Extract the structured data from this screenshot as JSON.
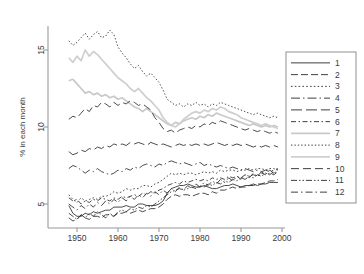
{
  "chart_data": {
    "type": "line",
    "title": "",
    "xlabel": "",
    "ylabel": "% in each month",
    "xlim": [
      1948,
      2000
    ],
    "ylim": [
      3.2,
      16.4
    ],
    "xticks": [
      1950,
      1960,
      1970,
      1980,
      1990,
      2000
    ],
    "yticks": [
      5,
      10,
      15
    ],
    "grid": false,
    "legend_position": "right",
    "x": [
      1948,
      1949,
      1950,
      1951,
      1952,
      1953,
      1954,
      1955,
      1956,
      1957,
      1958,
      1959,
      1960,
      1961,
      1962,
      1963,
      1964,
      1965,
      1966,
      1967,
      1968,
      1969,
      1970,
      1971,
      1972,
      1973,
      1974,
      1975,
      1976,
      1977,
      1978,
      1979,
      1980,
      1981,
      1982,
      1983,
      1984,
      1985,
      1986,
      1987,
      1988,
      1989,
      1990,
      1991,
      1992,
      1993,
      1994,
      1995,
      1996,
      1997,
      1998,
      1999
    ],
    "series": [
      {
        "name": "1",
        "label": "1",
        "style": "solid",
        "color": "#2a2a2a",
        "dash": "none",
        "values": [
          4.9,
          4.4,
          4.2,
          4.2,
          4.4,
          4.3,
          4.5,
          4.4,
          4.5,
          4.6,
          4.6,
          4.8,
          4.8,
          4.8,
          4.9,
          4.8,
          4.8,
          5.0,
          5.0,
          4.9,
          4.9,
          4.9,
          5.0,
          5.2,
          5.7,
          6.0,
          6.1,
          6.2,
          6.2,
          6.3,
          6.2,
          6.1,
          6.1,
          6.2,
          6.1,
          6.0,
          6.0,
          6.1,
          6.2,
          6.2,
          6.3,
          6.2,
          6.1,
          6.2,
          6.2,
          6.3,
          6.2,
          6.3,
          6.3,
          6.4,
          6.4,
          6.4
        ]
      },
      {
        "name": "2",
        "label": "2",
        "style": "dashed",
        "color": "#2a2a2a",
        "dash": "7,3",
        "values": [
          4.1,
          3.9,
          4.0,
          4.3,
          4.1,
          4.0,
          4.2,
          4.2,
          4.1,
          4.3,
          4.3,
          4.2,
          4.4,
          4.4,
          4.5,
          4.4,
          4.5,
          4.6,
          4.5,
          4.6,
          4.7,
          4.7,
          4.8,
          5.0,
          5.3,
          5.5,
          5.6,
          5.5,
          5.6,
          5.6,
          5.5,
          5.6,
          5.7,
          5.7,
          5.6,
          5.8,
          5.7,
          5.9,
          5.9,
          6.0,
          6.1,
          6.0,
          6.1,
          6.1,
          6.2,
          6.2,
          6.3,
          6.3,
          6.4,
          6.5,
          6.5,
          6.6
        ]
      },
      {
        "name": "3",
        "label": "3",
        "style": "dotted",
        "color": "#2a2a2a",
        "dash": "1.6,2.2",
        "values": [
          5.6,
          5.3,
          5.1,
          5.4,
          5.2,
          5.3,
          5.4,
          5.3,
          5.5,
          5.5,
          5.6,
          5.8,
          5.7,
          5.8,
          6.0,
          5.9,
          6.0,
          6.0,
          6.2,
          6.2,
          6.1,
          6.3,
          6.4,
          6.6,
          6.8,
          7.0,
          6.9,
          7.0,
          6.9,
          7.0,
          7.0,
          6.9,
          7.0,
          7.1,
          7.0,
          7.1,
          7.0,
          7.2,
          7.1,
          7.2,
          7.2,
          7.1,
          7.2,
          7.2,
          7.3,
          7.2,
          7.3,
          7.3,
          7.2,
          7.3,
          7.3,
          7.2
        ]
      },
      {
        "name": "4",
        "label": "4",
        "style": "dashdot-long",
        "color": "#2a2a2a",
        "dash": "9,3,1.5,3",
        "values": [
          7.3,
          7.5,
          7.4,
          7.2,
          7.0,
          7.2,
          7.1,
          7.3,
          7.1,
          7.0,
          6.9,
          7.0,
          7.2,
          7.1,
          7.3,
          7.2,
          7.4,
          7.3,
          7.5,
          7.6,
          7.5,
          7.4,
          7.6,
          7.5,
          7.7,
          7.8,
          7.7,
          7.6,
          7.7,
          7.6,
          7.5,
          7.6,
          7.7,
          7.5,
          7.6,
          7.5,
          7.4,
          7.5,
          7.4,
          7.3,
          7.4,
          7.3,
          7.2,
          7.3,
          7.2,
          7.1,
          7.2,
          7.1,
          7.2,
          7.1,
          7.2,
          7.3
        ]
      },
      {
        "name": "5",
        "label": "5",
        "style": "dashed-long",
        "color": "#2a2a2a",
        "dash": "11,4",
        "values": [
          8.4,
          8.2,
          8.3,
          8.5,
          8.4,
          8.6,
          8.5,
          8.7,
          8.6,
          8.8,
          8.7,
          8.9,
          8.8,
          8.9,
          8.8,
          9.0,
          8.9,
          9.0,
          8.9,
          8.8,
          9.0,
          8.9,
          8.8,
          8.9,
          8.8,
          8.7,
          8.8,
          8.9,
          8.8,
          8.9,
          8.8,
          8.9,
          8.8,
          8.9,
          8.8,
          8.9,
          9.0,
          8.9,
          8.8,
          8.9,
          8.8,
          8.9,
          8.8,
          8.9,
          8.8,
          8.7,
          8.8,
          8.7,
          8.8,
          8.7,
          8.8,
          8.7
        ]
      },
      {
        "name": "6",
        "label": "6",
        "style": "dashdot",
        "color": "#2a2a2a",
        "dash": "5,2.5,1.5,2.5",
        "values": [
          5.4,
          5.2,
          5.3,
          5.0,
          5.2,
          5.1,
          5.3,
          5.2,
          5.4,
          5.3,
          5.2,
          5.4,
          5.3,
          5.5,
          5.4,
          5.5,
          5.6,
          5.5,
          5.7,
          5.6,
          5.8,
          5.7,
          5.9,
          6.0,
          6.2,
          6.3,
          6.4,
          6.3,
          6.5,
          6.4,
          6.5,
          6.6,
          6.5,
          6.6,
          6.5,
          6.7,
          6.6,
          6.7,
          6.6,
          6.8,
          6.7,
          6.8,
          6.7,
          6.9,
          6.8,
          6.9,
          6.8,
          7.0,
          6.9,
          7.0,
          6.9,
          7.1
        ]
      },
      {
        "name": "7",
        "label": "7",
        "style": "solid-light",
        "color": "#c9c9c9",
        "dash": "none",
        "values": [
          13.0,
          13.1,
          12.8,
          12.5,
          12.2,
          12.3,
          12.1,
          12.2,
          12.0,
          12.1,
          11.9,
          12.0,
          11.8,
          11.9,
          11.7,
          11.5,
          11.3,
          11.2,
          11.0,
          11.2,
          11.0,
          10.8,
          10.6,
          10.4,
          10.2,
          10.1,
          10.3,
          10.2,
          10.4,
          10.5,
          10.6,
          10.5,
          10.7,
          10.6,
          10.8,
          10.7,
          10.9,
          10.8,
          10.7,
          10.6,
          10.5,
          10.4,
          10.3,
          10.2,
          10.1,
          10.2,
          10.1,
          10.0,
          10.1,
          10.0,
          10.1,
          10.0
        ]
      },
      {
        "name": "8",
        "label": "8",
        "style": "dotted-fine",
        "color": "#2a2a2a",
        "dash": "1.4,2.0",
        "values": [
          15.6,
          15.3,
          15.5,
          15.8,
          16.1,
          15.7,
          16.0,
          16.2,
          15.8,
          15.9,
          16.3,
          16.0,
          15.2,
          14.8,
          14.5,
          14.1,
          13.8,
          14.0,
          13.6,
          13.3,
          13.5,
          13.2,
          12.9,
          12.4,
          11.8,
          11.6,
          11.4,
          11.5,
          11.3,
          11.5,
          11.4,
          11.6,
          11.4,
          11.5,
          11.3,
          11.5,
          11.4,
          11.6,
          11.5,
          11.4,
          11.3,
          11.2,
          11.1,
          11.0,
          10.9,
          10.8,
          10.9,
          10.8,
          10.7,
          10.6,
          10.7,
          10.6
        ]
      },
      {
        "name": "9",
        "label": "9",
        "style": "solid-light2",
        "color": "#cfcfcf",
        "dash": "none",
        "values": [
          14.5,
          14.2,
          14.6,
          14.3,
          15.0,
          14.6,
          14.9,
          14.7,
          14.4,
          14.1,
          13.8,
          13.5,
          13.2,
          13.0,
          12.8,
          12.5,
          12.3,
          12.5,
          12.2,
          11.9,
          11.7,
          11.4,
          11.1,
          10.6,
          10.3,
          10.1,
          10.0,
          10.2,
          10.5,
          10.7,
          10.9,
          11.0,
          10.9,
          11.1,
          11.0,
          11.2,
          11.1,
          11.3,
          11.2,
          11.0,
          10.9,
          10.8,
          10.6,
          10.5,
          10.4,
          10.3,
          10.2,
          10.1,
          10.2,
          10.1,
          10.0,
          9.9
        ]
      },
      {
        "name": "10",
        "label": "10",
        "style": "dashed-med",
        "color": "#2a2a2a",
        "dash": "8,4",
        "values": [
          10.5,
          10.7,
          10.6,
          10.9,
          11.2,
          11.0,
          11.4,
          11.3,
          11.6,
          11.5,
          11.3,
          11.6,
          11.4,
          11.6,
          11.5,
          11.7,
          11.6,
          11.4,
          11.5,
          11.3,
          11.1,
          10.6,
          10.3,
          9.9,
          9.7,
          9.8,
          9.6,
          9.8,
          9.9,
          10.0,
          9.9,
          10.1,
          10.0,
          10.2,
          10.1,
          10.3,
          10.2,
          10.4,
          10.3,
          10.2,
          10.1,
          10.0,
          9.9,
          9.8,
          9.9,
          9.8,
          9.7,
          9.8,
          9.7,
          9.6,
          9.7,
          9.6
        ]
      },
      {
        "name": "11",
        "label": "11",
        "style": "dashdotdot",
        "color": "#2a2a2a",
        "dash": "6,2,1.5,2,1.5,2",
        "values": [
          4.4,
          4.2,
          4.0,
          4.3,
          4.1,
          4.4,
          4.2,
          4.5,
          4.3,
          4.1,
          4.4,
          4.2,
          4.5,
          4.6,
          4.5,
          4.7,
          4.6,
          4.8,
          4.7,
          4.9,
          4.8,
          5.0,
          5.2,
          5.4,
          5.6,
          5.8,
          5.9,
          6.0,
          5.9,
          6.0,
          6.1,
          6.0,
          6.2,
          6.1,
          6.3,
          6.2,
          6.4,
          6.3,
          6.5,
          6.4,
          6.6,
          6.5,
          6.7,
          6.6,
          6.8,
          6.7,
          6.9,
          6.8,
          7.0,
          6.9,
          7.1,
          7.0
        ]
      },
      {
        "name": "12",
        "label": "12",
        "style": "dashdot-wide",
        "color": "#2a2a2a",
        "dash": "7,3,1.5,3",
        "values": [
          5.0,
          4.8,
          4.6,
          4.9,
          4.7,
          5.0,
          4.8,
          5.1,
          4.9,
          5.2,
          5.0,
          5.3,
          5.1,
          5.4,
          5.2,
          5.5,
          5.3,
          5.6,
          5.4,
          5.7,
          5.5,
          5.8,
          5.6,
          5.9,
          5.7,
          6.0,
          5.8,
          6.1,
          5.9,
          6.2,
          6.0,
          6.3,
          6.1,
          6.4,
          6.2,
          6.5,
          6.3,
          6.6,
          6.4,
          6.7,
          6.5,
          6.8,
          6.6,
          6.9,
          6.7,
          7.0,
          6.8,
          7.1,
          6.9,
          7.2,
          7.0,
          7.3
        ]
      }
    ]
  },
  "legend": {
    "entries": [
      "1",
      "2",
      "3",
      "4",
      "5",
      "6",
      "7",
      "8",
      "9",
      "10",
      "11",
      "12"
    ]
  },
  "axes": {
    "y_title": "% in each month",
    "y_ticks": [
      "5",
      "10",
      "15"
    ],
    "x_ticks": [
      "1950",
      "1960",
      "1970",
      "1980",
      "1990",
      "2000"
    ]
  }
}
